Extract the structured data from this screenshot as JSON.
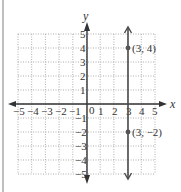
{
  "chart_data": {
    "type": "line",
    "title": "",
    "xlabel": "x",
    "ylabel": "y",
    "xlim": [
      -5,
      5
    ],
    "ylim": [
      -5,
      5
    ],
    "grid": true,
    "grid_style": "dotted",
    "x_ticks": [
      "-5",
      "-4",
      "-3",
      "-2",
      "-1",
      "0",
      "1",
      "2",
      "3",
      "4",
      "5"
    ],
    "y_ticks": [
      "-5",
      "-4",
      "-3",
      "-2",
      "-1",
      "1",
      "2",
      "3",
      "4",
      "5"
    ],
    "series": [
      {
        "name": "vertical line x = 3",
        "kind": "vertical_line",
        "x": [
          3,
          3
        ],
        "y": [
          -5,
          5
        ],
        "arrows_both_ends": true
      },
      {
        "name": "points",
        "kind": "scatter",
        "points": [
          {
            "x": 3,
            "y": 4,
            "label": "(3, 4)"
          },
          {
            "x": 3,
            "y": -2,
            "label": "(3, −2)"
          }
        ]
      }
    ],
    "annotations": [
      "(3, 4)",
      "(3, −2)"
    ]
  },
  "labels": {
    "x_axis": "x",
    "y_axis": "y",
    "origin": "0",
    "point_a": "(3, 4)",
    "point_b": "(3, −2)",
    "x_neg": [
      "−5",
      "−4",
      "−3",
      "−2",
      "−1"
    ],
    "x_pos": [
      "1",
      "2",
      "3",
      "4",
      "5"
    ],
    "y_pos": [
      "1",
      "2",
      "3",
      "4",
      "5"
    ],
    "y_neg": [
      "−1",
      "−2",
      "−3",
      "−4",
      "−5"
    ]
  },
  "colors": {
    "axis": "#333333",
    "grid": "#9a9a9a",
    "line": "#4a4a4a",
    "point": "#555555"
  }
}
